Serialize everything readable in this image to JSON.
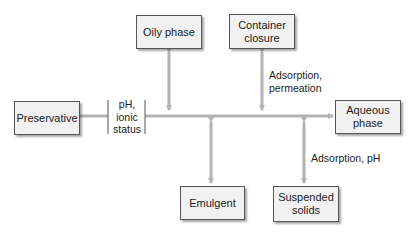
{
  "diagram": {
    "nodes": {
      "preservative": "Preservative",
      "oily_phase": "Oily phase",
      "container_closure_line1": "Container",
      "container_closure_line2": "closure",
      "aqueous_phase_line1": "Aqueous",
      "aqueous_phase_line2": "phase",
      "emulgent": "Emulgent",
      "suspended_solids_line1": "Suspended",
      "suspended_solids_line2": "solids"
    },
    "modifier": {
      "line1": "pH,",
      "line2": "ionic",
      "line3": "status"
    },
    "edge_labels": {
      "container_line1": "Adsorption,",
      "container_line2": "permeation",
      "suspended": "Adsorption, pH"
    },
    "colors": {
      "arrow": "#b3b3b3",
      "box_fill": "#f1f1f1",
      "box_border": "#555555"
    }
  }
}
